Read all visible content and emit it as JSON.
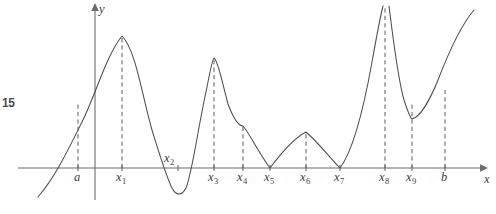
{
  "figure": {
    "number_label": "15",
    "axes": {
      "x_label": "x",
      "y_label": "y",
      "x_axis_y_px": 168,
      "y_axis_x_px": 95,
      "x_axis_from_px": 18,
      "x_axis_to_px": 486,
      "y_axis_from_px": 200,
      "y_axis_to_px": 6
    },
    "tick_marks": [
      {
        "name": "a",
        "base": "a",
        "sub": "",
        "x_px": 78,
        "label_x_px": 74,
        "label_y_px": 181,
        "drop_top_px": 104,
        "dashed": true
      },
      {
        "name": "x1",
        "base": "x",
        "sub": "1",
        "x_px": 122,
        "label_x_px": 116,
        "label_y_px": 181,
        "drop_top_px": 36,
        "dashed": true
      },
      {
        "name": "x2",
        "base": "x",
        "sub": "2",
        "x_px": 178,
        "label_x_px": 164,
        "label_y_px": 162,
        "drop_top_px": 168,
        "dashed": true
      },
      {
        "name": "x3",
        "base": "x",
        "sub": "3",
        "x_px": 214,
        "label_x_px": 208,
        "label_y_px": 181,
        "drop_top_px": 58,
        "dashed": true
      },
      {
        "name": "x4",
        "base": "x",
        "sub": "4",
        "x_px": 243,
        "label_x_px": 237,
        "label_y_px": 181,
        "drop_top_px": 126,
        "dashed": true
      },
      {
        "name": "x5",
        "base": "x",
        "sub": "5",
        "x_px": 270,
        "label_x_px": 264,
        "label_y_px": 181,
        "drop_top_px": 168,
        "dashed": false
      },
      {
        "name": "x6",
        "base": "x",
        "sub": "6",
        "x_px": 306,
        "label_x_px": 300,
        "label_y_px": 181,
        "drop_top_px": 132,
        "dashed": true
      },
      {
        "name": "x7",
        "base": "x",
        "sub": "7",
        "x_px": 340,
        "label_x_px": 334,
        "label_y_px": 181,
        "drop_top_px": 168,
        "dashed": false
      },
      {
        "name": "x8",
        "base": "x",
        "sub": "8",
        "x_px": 385,
        "label_x_px": 379,
        "label_y_px": 181,
        "drop_top_px": 6,
        "dashed": true
      },
      {
        "name": "x9",
        "base": "x",
        "sub": "9",
        "x_px": 412,
        "label_x_px": 406,
        "label_y_px": 181,
        "drop_top_px": 104,
        "dashed": true
      },
      {
        "name": "b",
        "base": "b",
        "sub": "",
        "x_px": 445,
        "label_x_px": 441,
        "label_y_px": 181,
        "drop_top_px": 90,
        "dashed": true
      }
    ],
    "curve_segments": [
      "M 38 197 C 56 176 70 146 82 122 C 96 94 106 56 122 36 C 136 50 142 96 152 130 C 160 156 166 176 172 188 C 176 196 182 196 186 188 C 192 174 198 128 206 92 C 210 72 212 60 214 58 C 218 60 222 82 228 104 C 234 120 239 126 243 126 C 250 134 258 152 270 168 C 282 152 294 138 306 132 C 318 142 330 158 340 168 C 352 152 362 118 372 62 C 377 34 381 14 383 6",
      "M 389 6 C 392 30 398 80 404 100 C 408 112 410 118 412 119 C 420 117 430 100 438 80 C 448 54 462 24 474 10"
    ],
    "curve_style": {
      "stroke_color": "#4d4d4d",
      "stroke_width": 1.05
    },
    "background_color": "#ffffff"
  },
  "chart_data": {
    "type": "line",
    "title": "",
    "xlabel": "x",
    "ylabel": "y",
    "grid": false,
    "legend": null,
    "categories": [
      "a",
      "x1",
      "x2",
      "x3",
      "x4",
      "x5",
      "x6",
      "x7",
      "x8",
      "x9",
      "b"
    ],
    "annotations": [
      {
        "label": "a",
        "type": "left-endpoint",
        "feature": "left endpoint of domain, curve crosses upward"
      },
      {
        "label": "x1",
        "type": "local-maximum",
        "feature": "smooth rounded peak, highest of the left region"
      },
      {
        "label": "x2",
        "type": "local-minimum",
        "feature": "smooth minimum below the x-axis, absolute minimum"
      },
      {
        "label": "x3",
        "type": "local-maximum",
        "feature": "smooth rounded peak above the x-axis"
      },
      {
        "label": "x4",
        "type": "corner",
        "feature": "corner point, derivative undefined"
      },
      {
        "label": "x5",
        "type": "cusp-minimum",
        "feature": "sharp downward cusp touching the x-axis"
      },
      {
        "label": "x6",
        "type": "corner-maximum",
        "feature": "corner peak, derivative undefined"
      },
      {
        "label": "x7",
        "type": "cusp-minimum",
        "feature": "sharp V minimum touching the x-axis"
      },
      {
        "label": "x8",
        "type": "vertical-asymptote",
        "feature": "curve tends to +infinity on both sides"
      },
      {
        "label": "x9",
        "type": "local-minimum",
        "feature": "smooth minimum well above the x-axis"
      },
      {
        "label": "b",
        "type": "right-endpoint",
        "feature": "right endpoint of domain, curve increasing"
      }
    ],
    "x": [
      38,
      78,
      122,
      178,
      214,
      243,
      270,
      306,
      340,
      385,
      412,
      445,
      474
    ],
    "y_pixel": [
      197,
      122,
      36,
      190,
      58,
      126,
      168,
      132,
      168,
      6,
      119,
      80,
      10
    ],
    "axis_baseline_y_px": 168
  }
}
